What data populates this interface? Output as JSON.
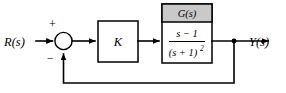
{
  "diagram": {
    "input_label": "R(s)",
    "output_label": "Y(s)",
    "gain_label": "K",
    "plant_header": "G(s)",
    "plant_numerator": "s − 1",
    "plant_denominator_base": "(s + 1)",
    "plant_denominator_exponent": "2",
    "sum_plus_sign": "+",
    "sum_minus_sign": "−",
    "colors": {
      "line": "#000000",
      "header_fill": "#c9c9c9",
      "block_fill": "#ffffff",
      "background": "#ffffff"
    }
  }
}
